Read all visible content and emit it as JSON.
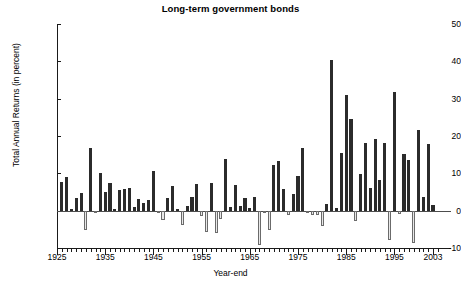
{
  "chart_data": {
    "type": "bar",
    "title": "Long-term government bonds",
    "xlabel": "Year-end",
    "ylabel": "Total Annual Returns (in percent)",
    "ylim": [
      -10,
      50
    ],
    "yticks": [
      50,
      40,
      30,
      20,
      10,
      0,
      -10
    ],
    "xticks": [
      1925,
      1935,
      1945,
      1955,
      1965,
      1975,
      1985,
      1995,
      2003
    ],
    "xlim": [
      1925,
      2004
    ],
    "grid": false,
    "legend": null,
    "series_name": "Total Annual Return",
    "colors": {
      "positive_bar": "#2b2b2b",
      "negative_bar": "#e8e8e8",
      "negative_bar_border": "#6b6b6b",
      "axis": "#1a1a1a",
      "background": "#ffffff",
      "text": "#000000"
    },
    "categories": [
      1926,
      1927,
      1928,
      1929,
      1930,
      1931,
      1932,
      1933,
      1934,
      1935,
      1936,
      1937,
      1938,
      1939,
      1940,
      1941,
      1942,
      1943,
      1944,
      1945,
      1946,
      1947,
      1948,
      1949,
      1950,
      1951,
      1952,
      1953,
      1954,
      1955,
      1956,
      1957,
      1958,
      1959,
      1960,
      1961,
      1962,
      1963,
      1964,
      1965,
      1966,
      1967,
      1968,
      1969,
      1970,
      1971,
      1972,
      1973,
      1974,
      1975,
      1976,
      1977,
      1978,
      1979,
      1980,
      1981,
      1982,
      1983,
      1984,
      1985,
      1986,
      1987,
      1988,
      1989,
      1990,
      1991,
      1992,
      1993,
      1994,
      1995,
      1996,
      1997,
      1998,
      1999,
      2000,
      2001,
      2002,
      2003
    ],
    "values": [
      7.8,
      8.9,
      0.1,
      3.4,
      4.7,
      -5.3,
      16.8,
      -0.1,
      10.0,
      5.0,
      7.5,
      0.2,
      5.5,
      5.9,
      6.1,
      0.9,
      3.2,
      2.1,
      2.8,
      10.7,
      -0.1,
      -2.6,
      3.4,
      6.5,
      0.1,
      -3.9,
      1.2,
      3.6,
      7.2,
      -1.3,
      -5.6,
      7.5,
      -6.1,
      -2.3,
      13.8,
      1.0,
      6.9,
      1.2,
      3.5,
      0.7,
      3.7,
      -9.2,
      -0.3,
      -5.1,
      12.1,
      13.2,
      5.7,
      -1.1,
      4.4,
      9.2,
      16.8,
      -0.7,
      -1.2,
      -1.2,
      -4.0,
      1.9,
      40.4,
      0.7,
      15.5,
      31.0,
      24.5,
      -2.7,
      9.7,
      18.1,
      6.2,
      19.3,
      8.1,
      18.2,
      -7.8,
      31.7,
      -0.9,
      15.1,
      13.5,
      -8.7,
      21.5,
      3.7,
      17.8,
      1.5
    ]
  }
}
